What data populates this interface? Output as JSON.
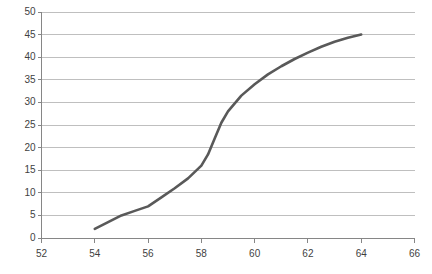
{
  "chart_data": {
    "type": "line",
    "title": "",
    "xlabel": "",
    "ylabel": "",
    "xlim": [
      52,
      66
    ],
    "ylim": [
      0,
      50
    ],
    "xticks": [
      52,
      54,
      56,
      58,
      60,
      62,
      64,
      66
    ],
    "yticks": [
      0,
      5,
      10,
      15,
      20,
      25,
      30,
      35,
      40,
      45,
      50
    ],
    "grid": "horizontal",
    "legend": "none",
    "series": [
      {
        "name": "series-1",
        "color": "#595959",
        "x": [
          54,
          54.5,
          55,
          55.5,
          56,
          56.5,
          57,
          57.5,
          58,
          58.25,
          58.5,
          58.75,
          59,
          59.5,
          60,
          60.5,
          61,
          61.5,
          62,
          62.5,
          63,
          63.5,
          64
        ],
        "values": [
          2,
          3.5,
          5,
          6,
          7,
          9,
          11,
          13.2,
          16,
          18.5,
          22,
          25.5,
          28,
          31.5,
          34,
          36.2,
          38,
          39.6,
          41,
          42.3,
          43.4,
          44.3,
          45
        ]
      }
    ]
  },
  "axis": {
    "x_tick_labels": [
      "52",
      "54",
      "56",
      "58",
      "60",
      "62",
      "64",
      "66"
    ],
    "y_tick_labels": [
      "0",
      "5",
      "10",
      "15",
      "20",
      "25",
      "30",
      "35",
      "40",
      "45",
      "50"
    ]
  },
  "colors": {
    "line": "#595959",
    "grid": "#bfbfbf",
    "axis": "#868686",
    "text": "#3f3f3f",
    "background": "#ffffff"
  }
}
